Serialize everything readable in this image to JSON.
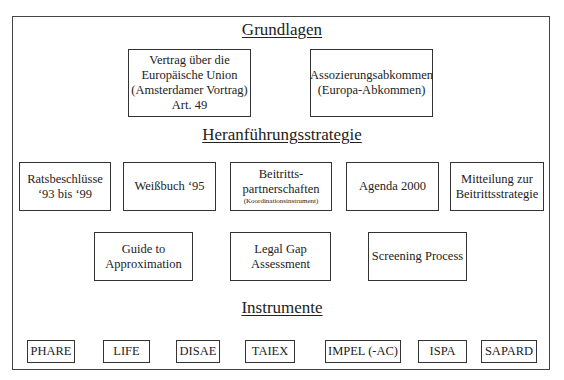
{
  "diagram": {
    "clipped_header_text": "",
    "sections": {
      "grundlagen": {
        "title": "Grundlagen",
        "boxes": [
          {
            "lines": [
              "Vertrag über die",
              "Europäische Union",
              "(Amsterdamer Vortrag)",
              "Art. 49"
            ]
          },
          {
            "lines": [
              "Assozierungsabkommen",
              "(Europa-Abkommen)"
            ]
          }
        ]
      },
      "heranfuehrung": {
        "title": "Heranführungsstrategie",
        "boxes": [
          {
            "lines": [
              "Ratsbeschlüsse",
              "‘93 bis ‘99"
            ]
          },
          {
            "lines": [
              "Weißbuch ‘95"
            ]
          },
          {
            "lines": [
              "Beitritts-",
              "partnerschaften"
            ],
            "note": "(Koordinationsinstrument)"
          },
          {
            "lines": [
              "Agenda 2000"
            ]
          },
          {
            "lines": [
              "Mitteilung zur",
              "Beitrittsstrategie"
            ]
          }
        ],
        "boxes_row2": [
          {
            "lines": [
              "Guide to",
              "Approximation"
            ]
          },
          {
            "lines": [
              "Legal Gap",
              "Assessment"
            ]
          },
          {
            "lines": [
              "Screening Process"
            ]
          }
        ]
      },
      "instrumente": {
        "title": "Instrumente",
        "items": [
          "PHARE",
          "LIFE",
          "DISAE",
          "TAIEX",
          "IMPEL (-AC)",
          "ISPA",
          "SAPARD"
        ]
      }
    }
  }
}
